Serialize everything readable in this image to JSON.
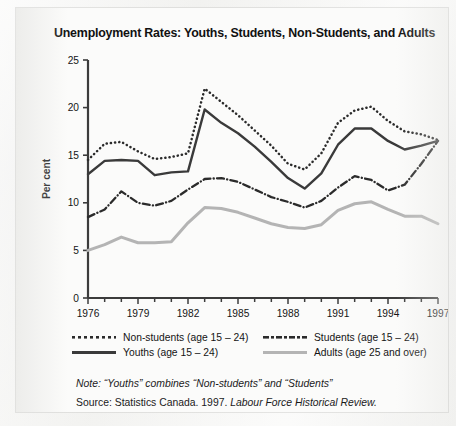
{
  "title": "Unemployment Rates: Youths, Students, Non-Students, and Adults",
  "legend": {
    "items": [
      {
        "label": "Non-students (age 15 – 24)",
        "style": "dotted",
        "color": "#2b2b2b"
      },
      {
        "label": "Students (age 15 – 24)",
        "style": "dash-dot",
        "color": "#2b2b2b"
      },
      {
        "label": "Youths (age 15 – 24)",
        "style": "solid",
        "color": "#3a3a3a"
      },
      {
        "label": "Adults (age 25 and over)",
        "style": "solid",
        "color": "#b4b4b4"
      }
    ]
  },
  "note": {
    "lead": "Note:",
    "text": " “Youths” combines “Non-students” and “Students”"
  },
  "source": {
    "lead": "Source:",
    "text": " Statistics Canada. 1997. ",
    "italic": "Labour Force Historical Review."
  },
  "chart_data": {
    "type": "line",
    "title": "Unemployment Rates: Youths, Students, Non-Students, and Adults",
    "xlabel": "",
    "ylabel": "Per cent",
    "xlim": [
      1976,
      1997
    ],
    "ylim": [
      0,
      25
    ],
    "ytick_step": 5,
    "yticks": [
      0,
      5,
      10,
      15,
      20,
      25
    ],
    "xticks": [
      1976,
      1979,
      1982,
      1985,
      1988,
      1991,
      1994,
      1997
    ],
    "xtick_minor_step": 1,
    "grid": false,
    "legend_position": "below-plot",
    "x": [
      1976,
      1977,
      1978,
      1979,
      1980,
      1981,
      1982,
      1983,
      1984,
      1985,
      1986,
      1987,
      1988,
      1989,
      1990,
      1991,
      1992,
      1993,
      1994,
      1995,
      1996,
      1997
    ],
    "series": [
      {
        "name": "Non-students (age 15 – 24)",
        "style": "dotted",
        "color": "#2b2b2b",
        "values": [
          14.5,
          16.2,
          16.4,
          15.4,
          14.6,
          14.8,
          15.2,
          22.0,
          20.6,
          19.2,
          17.6,
          16.0,
          14.1,
          13.5,
          15.2,
          18.4,
          19.7,
          20.1,
          18.6,
          17.5,
          17.2,
          16.6
        ]
      },
      {
        "name": "Students (age 15 – 24)",
        "style": "dash-dot",
        "color": "#2b2b2b",
        "values": [
          8.5,
          9.3,
          11.2,
          10.0,
          9.7,
          10.2,
          11.4,
          12.5,
          12.6,
          12.2,
          11.4,
          10.6,
          10.1,
          9.5,
          10.2,
          11.6,
          12.8,
          12.4,
          11.3,
          11.9,
          14.1,
          16.5
        ]
      },
      {
        "name": "Youths (age 15 – 24)",
        "style": "solid",
        "color": "#3a3a3a",
        "values": [
          13.0,
          14.4,
          14.5,
          14.4,
          12.9,
          13.2,
          13.3,
          19.8,
          18.4,
          17.3,
          15.9,
          14.3,
          12.6,
          11.5,
          13.1,
          16.1,
          17.8,
          17.8,
          16.5,
          15.6,
          16.0,
          16.5
        ]
      },
      {
        "name": "Adults (age 25 and over)",
        "style": "solid",
        "color": "#b4b4b4",
        "values": [
          5.0,
          5.6,
          6.4,
          5.8,
          5.8,
          5.9,
          7.9,
          9.5,
          9.4,
          9.0,
          8.4,
          7.8,
          7.4,
          7.3,
          7.7,
          9.2,
          9.9,
          10.1,
          9.3,
          8.6,
          8.6,
          7.8
        ]
      }
    ]
  }
}
